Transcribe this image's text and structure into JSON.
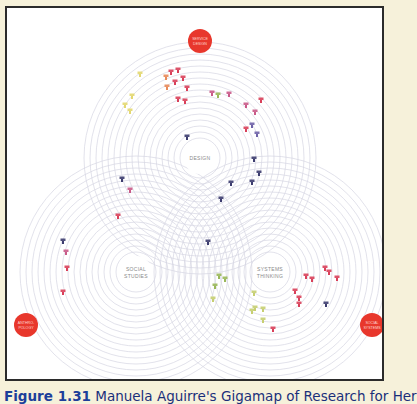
{
  "diagram": {
    "title": "Gigamap of research",
    "circles": [
      {
        "id": "design",
        "label": "DESIGN"
      },
      {
        "id": "social",
        "label_lines": [
          "SOCIAL",
          "STUDIES"
        ]
      },
      {
        "id": "systems",
        "label_lines": [
          "SYSTEMS",
          "THINKING"
        ]
      }
    ],
    "nodes": [
      {
        "id": "service-design",
        "label_lines": [
          "SERVICE",
          "DESIGN"
        ]
      },
      {
        "id": "anthropology",
        "label_lines": [
          "ANTHRO-",
          "POLOGY"
        ]
      },
      {
        "id": "social-systems",
        "label_lines": [
          "SOCIAL",
          "SYSTEMS"
        ]
      }
    ],
    "colors": {
      "node_red": "#e8372c",
      "ring": "#d6d6e2",
      "label": "#8a8a8a",
      "marker_yellow": "#e3d872",
      "marker_orange": "#e88a5a",
      "marker_red": "#d9405a",
      "marker_pink": "#c95a88",
      "marker_purple": "#6f63a8",
      "marker_navy": "#3d3d6f",
      "marker_green": "#9ab85a",
      "marker_lime": "#c7cf72"
    },
    "markers": [
      {
        "c": "marker_yellow"
      },
      {
        "c": "marker_yellow"
      },
      {
        "c": "marker_yellow"
      },
      {
        "c": "marker_yellow"
      },
      {
        "c": "marker_orange"
      },
      {
        "c": "marker_orange"
      },
      {
        "c": "marker_red"
      },
      {
        "c": "marker_red"
      },
      {
        "c": "marker_red"
      },
      {
        "c": "marker_red"
      },
      {
        "c": "marker_red"
      },
      {
        "c": "marker_red"
      },
      {
        "c": "marker_red"
      },
      {
        "c": "marker_pink"
      },
      {
        "c": "marker_pink"
      },
      {
        "c": "marker_pink"
      },
      {
        "c": "marker_pink"
      },
      {
        "c": "marker_purple"
      },
      {
        "c": "marker_purple"
      },
      {
        "c": "marker_navy"
      },
      {
        "c": "marker_navy"
      },
      {
        "c": "marker_navy"
      },
      {
        "c": "marker_navy"
      },
      {
        "c": "marker_navy"
      },
      {
        "c": "marker_navy"
      },
      {
        "c": "marker_navy"
      },
      {
        "c": "marker_navy"
      },
      {
        "c": "marker_red"
      },
      {
        "c": "marker_red"
      },
      {
        "c": "marker_red"
      },
      {
        "c": "marker_green"
      },
      {
        "c": "marker_green"
      },
      {
        "c": "marker_green"
      },
      {
        "c": "marker_green"
      },
      {
        "c": "marker_lime"
      },
      {
        "c": "marker_lime"
      },
      {
        "c": "marker_lime"
      },
      {
        "c": "marker_lime"
      },
      {
        "c": "marker_lime"
      },
      {
        "c": "marker_lime"
      },
      {
        "c": "marker_red"
      },
      {
        "c": "marker_red"
      },
      {
        "c": "marker_red"
      },
      {
        "c": "marker_red"
      },
      {
        "c": "marker_red"
      },
      {
        "c": "marker_red"
      },
      {
        "c": "marker_navy"
      },
      {
        "c": "marker_pink"
      }
    ]
  },
  "caption": {
    "figure": "Figure 1.31",
    "text": " Manuela Aguirre's Gigamap of Research for Her"
  }
}
